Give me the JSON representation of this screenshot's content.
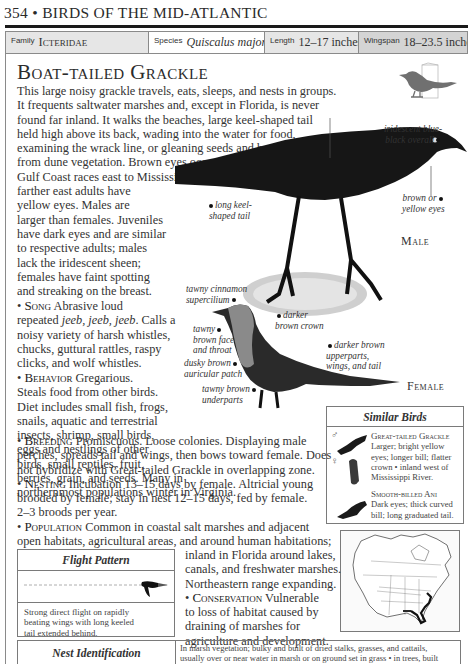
{
  "header": {
    "running_head": "354 • BIRDS OF THE MID-ATLANTIC"
  },
  "info_bar": {
    "family_label": "Family",
    "family_value": "Icteridae",
    "species_label": "Species",
    "species_value": "Quiscalus major",
    "length_label": "Length",
    "length_value": "12–17 inches",
    "wingspan_label": "Wingspan",
    "wingspan_value": "18–23.5 inches"
  },
  "species": {
    "common_name": "Boat-tailed Grackle",
    "silhouette_icon": "perching-bird-silhouette-icon"
  },
  "intro_lines": [
    "This large noisy grackle travels, eats, sleeps, and nests in groups.",
    "It frequents saltwater marshes and, except in Florida, is never",
    "found far inland. It walks the beaches, large keel-shaped tail",
    "held high above its back, wading into the water for food,",
    "examining the wrack line, or gleaning seeds and berries",
    "from dune vegetation. Brown eyes occur in western",
    "Gulf Coast races east to Mississippi;",
    "farther east adults have",
    "yellow eyes. Males are",
    "larger than females. Juveniles",
    "have dark eyes and are similar",
    "to respective adults; males",
    "lack the iridescent sheen;",
    "females have faint spotting",
    "and streaking on the breast."
  ],
  "sections": {
    "song": {
      "label": "Song",
      "lines_before": "Abrasive loud",
      "line2_pre": "repeated ",
      "line2_italic": "jeeb, jeeb, jeeb",
      "line2_post": ". Calls a",
      "rest": [
        "noisy variety of harsh whistles,",
        "chucks, guttural rattles, raspy",
        "clicks, and wolf whistles."
      ]
    },
    "behavior": {
      "label": "Behavior",
      "first": "Gregarious.",
      "rest": [
        "Steals food from other birds.",
        "Diet includes small fish, frogs,",
        "snails, aquatic and terrestrial",
        "insects, shrimp, small birds,",
        "eggs and nestlings of other",
        "birds, small reptiles, fruit,",
        "berries, grain, and seeds. Many in",
        "northernmost populations winter in Virginia."
      ]
    },
    "breeding": {
      "label": "Breeding",
      "first": "Promiscuous. Loose colonies. Displaying male",
      "rest": [
        "perches, spreads tail and wings, then bows toward female. Does",
        "not hybridize with Great-tailed Grackle in overlapping zone."
      ]
    },
    "nesting": {
      "label": "Nesting",
      "first": "Incubation 13–15 days by female. Altricial young",
      "rest": [
        "brooded by female; stay in nest 12–15 days, fed by female.",
        "2–3 broods per year."
      ]
    },
    "population": {
      "label": "Population",
      "first": "Common in coastal salt marshes and adjacent",
      "rest": [
        "open habitats, agricultural areas, and around human habitations;",
        "inland in Florida around lakes,",
        "canals, and freshwater marshes.",
        "Northeastern range expanding."
      ]
    },
    "conservation": {
      "label": "Conservation",
      "first": "Vulnerable",
      "rest": [
        "to loss of habitat caused by",
        "draining of marshes for",
        "agriculture and development."
      ]
    }
  },
  "illustration": {
    "male_label": "Male",
    "female_label": "Female",
    "male_callouts": {
      "overall": [
        "iridescent blue-",
        "black overall"
      ],
      "tail": [
        "long keel-",
        "shaped tail"
      ],
      "eyes": [
        "brown or",
        "yellow eyes"
      ]
    },
    "female_callouts": {
      "supercilium": [
        "tawny cinnamon",
        "supercilium"
      ],
      "crown": [
        "darker",
        "brown crown"
      ],
      "face": [
        "tawny",
        "brown face",
        "and throat"
      ],
      "upperparts": [
        "darker brown",
        "upperparts,",
        "wings, and tail"
      ],
      "auricular": [
        "dusky brown",
        "auricular patch"
      ],
      "underparts": [
        "tawny brown",
        "underparts"
      ]
    }
  },
  "similar_birds": {
    "title": "Similar Birds",
    "male_symbol": "♂",
    "female_symbol": "♀",
    "entries": [
      {
        "name": "Great-tailed Grackle",
        "lines": [
          "Larger; bright yellow",
          "eyes; longer bill; flatter",
          "crown • inland west of",
          "Mississippi River."
        ]
      },
      {
        "name": "Smooth-billed Ani",
        "lines": [
          "Dark eyes; thick curved",
          "bill; long graduated tail."
        ]
      }
    ]
  },
  "flight_pattern": {
    "title": "Flight Pattern",
    "description": [
      "Strong direct flight on rapidly",
      "beating wings with long keeled",
      "tail extended behind."
    ]
  },
  "range_map": {
    "label": "range-map-north-america"
  },
  "nest_identification": {
    "title": "Nest Identification",
    "lines": [
      "In marsh vegetation; bulky and built of dried stalks, grasses, and cattails,",
      "usually over or near water in marsh or on ground set in grass • in trees, built"
    ]
  },
  "colors": {
    "text": "#333333",
    "rule": "#1a1a1a",
    "family_bg": "#e6e6e6",
    "wingspan_bg": "#d4d4d4",
    "border": "#7a7a7a",
    "silhouette": "#707070"
  }
}
